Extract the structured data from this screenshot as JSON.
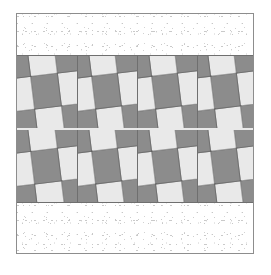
{
  "image": {
    "title": "Pieced quilt panel with two nine-patch strips",
    "width": 271,
    "height": 275,
    "background_color": "#ffffff"
  },
  "frame": {
    "border_color": "#8d8d8d",
    "x": 16,
    "y": 13,
    "width": 238,
    "height": 241
  },
  "palette": {
    "dark_patch": "#8c8c8c",
    "light_patch": "#e9e9e9",
    "seam_line": "#6f6f6f",
    "stipple_dot": "#cccccc",
    "background": "#ffffff"
  },
  "bands": [
    {
      "name": "top-stipple-band",
      "kind": "stipple",
      "top": 0,
      "height": 41
    },
    {
      "name": "upper-patch-stripe",
      "kind": "patchwork",
      "top": 41,
      "height": 73,
      "block_count": 4,
      "tilt_degrees": -7,
      "blocks": [
        {
          "label": "nine-patch-block-1",
          "tilt": -7,
          "grid": [
            "d",
            "l",
            "d",
            "l",
            "d",
            "l",
            "d",
            "l",
            "d"
          ]
        },
        {
          "label": "nine-patch-block-2",
          "tilt": -7,
          "grid": [
            "d",
            "l",
            "d",
            "l",
            "d",
            "l",
            "d",
            "l",
            "d"
          ]
        },
        {
          "label": "nine-patch-block-3",
          "tilt": -7,
          "grid": [
            "d",
            "l",
            "d",
            "l",
            "d",
            "l",
            "d",
            "l",
            "d"
          ]
        },
        {
          "label": "nine-patch-block-4",
          "tilt": -7,
          "grid": [
            "d",
            "l",
            "d",
            "l",
            "d",
            "l",
            "d",
            "l",
            "d"
          ]
        }
      ]
    },
    {
      "name": "stripe-separator",
      "kind": "seam",
      "top": 114,
      "height": 2
    },
    {
      "name": "lower-patch-stripe",
      "kind": "patchwork",
      "top": 116,
      "height": 73,
      "block_count": 4,
      "tilt_degrees": -7,
      "blocks": [
        {
          "label": "nine-patch-block-5",
          "tilt": -7,
          "grid": [
            "d",
            "l",
            "d",
            "l",
            "d",
            "l",
            "d",
            "l",
            "d"
          ]
        },
        {
          "label": "nine-patch-block-6",
          "tilt": -7,
          "grid": [
            "d",
            "l",
            "d",
            "l",
            "d",
            "l",
            "d",
            "l",
            "d"
          ]
        },
        {
          "label": "nine-patch-block-7",
          "tilt": -7,
          "grid": [
            "d",
            "l",
            "d",
            "l",
            "d",
            "l",
            "d",
            "l",
            "d"
          ]
        },
        {
          "label": "nine-patch-block-8",
          "tilt": -7,
          "grid": [
            "d",
            "l",
            "d",
            "l",
            "d",
            "l",
            "d",
            "l",
            "d"
          ]
        }
      ]
    },
    {
      "name": "bottom-stipple-band",
      "kind": "stipple",
      "top": 189,
      "height": 50
    }
  ],
  "block_columns": {
    "upper": [
      {
        "left": 0,
        "width": 61
      },
      {
        "left": 61,
        "width": 60
      },
      {
        "left": 121,
        "width": 60
      },
      {
        "left": 181,
        "width": 57
      }
    ],
    "lower": [
      {
        "left": 0,
        "width": 61
      },
      {
        "left": 61,
        "width": 60
      },
      {
        "left": 121,
        "width": 60
      },
      {
        "left": 181,
        "width": 57
      }
    ]
  }
}
